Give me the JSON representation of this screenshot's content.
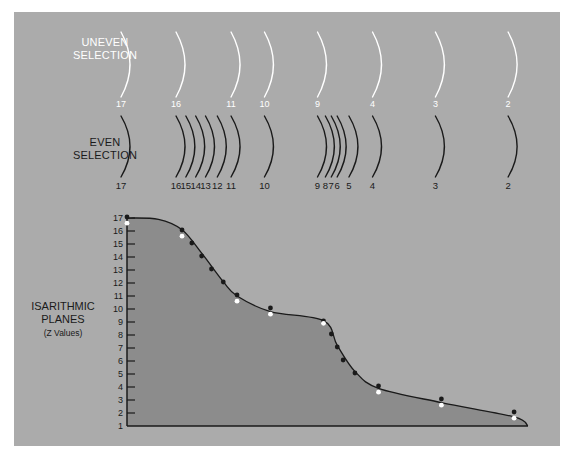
{
  "uneven_selection": {
    "label_line1": "UNEVEN",
    "label_line2": "SELECTION",
    "arcs": [
      {
        "value": "17",
        "pos": 0
      },
      {
        "value": "16",
        "pos": 1
      },
      {
        "value": "11",
        "pos": 6
      },
      {
        "value": "10",
        "pos": 7
      },
      {
        "value": "9",
        "pos": 8
      },
      {
        "value": "4",
        "pos": 13
      },
      {
        "value": "3",
        "pos": 14
      },
      {
        "value": "2",
        "pos": 15
      }
    ]
  },
  "even_selection": {
    "label_line1": "EVEN",
    "label_line2": "SELECTION",
    "arcs": [
      {
        "value": "17",
        "pos": 0
      },
      {
        "value": "16",
        "pos": 1
      },
      {
        "value": "15",
        "pos": 2
      },
      {
        "value": "14",
        "pos": 3
      },
      {
        "value": "13",
        "pos": 4
      },
      {
        "value": "12",
        "pos": 5
      },
      {
        "value": "11",
        "pos": 6
      },
      {
        "value": "10",
        "pos": 7
      },
      {
        "value": "9",
        "pos": 8
      },
      {
        "value": "8",
        "pos": 9
      },
      {
        "value": "7",
        "pos": 10
      },
      {
        "value": "6",
        "pos": 11
      },
      {
        "value": "5",
        "pos": 12
      },
      {
        "value": "4",
        "pos": 13
      },
      {
        "value": "3",
        "pos": 14
      },
      {
        "value": "2",
        "pos": 15
      }
    ]
  },
  "axis_title": {
    "line1": "ISARITHMIC",
    "line2": "PLANES",
    "line3": "(Z Values)"
  },
  "colors": {
    "panel": "#ababab",
    "profile_fill": "#8c8c8c",
    "ink": "#1a1a1a",
    "white": "#ffffff"
  },
  "chart_data": {
    "type": "area",
    "title": "",
    "ylabel": "ISARITHMIC PLANES (Z Values)",
    "xlabel": "",
    "ylim": [
      1,
      17
    ],
    "yticks": [
      "1",
      "2",
      "3",
      "4",
      "5",
      "6",
      "7",
      "8",
      "9",
      "10",
      "11",
      "12",
      "13",
      "14",
      "15",
      "16",
      "17"
    ],
    "grid": false,
    "x_positions_relative": [
      0,
      0.14,
      0.165,
      0.19,
      0.215,
      0.245,
      0.28,
      0.365,
      0.5,
      0.52,
      0.535,
      0.55,
      0.58,
      0.64,
      0.8,
      0.985
    ],
    "even_points": [
      {
        "z": 17,
        "x": 0.0
      },
      {
        "z": 16,
        "x": 0.14
      },
      {
        "z": 15,
        "x": 0.165
      },
      {
        "z": 14,
        "x": 0.19
      },
      {
        "z": 13,
        "x": 0.215
      },
      {
        "z": 12,
        "x": 0.245
      },
      {
        "z": 11,
        "x": 0.28
      },
      {
        "z": 10,
        "x": 0.365
      },
      {
        "z": 9,
        "x": 0.5
      },
      {
        "z": 8,
        "x": 0.52
      },
      {
        "z": 7,
        "x": 0.535
      },
      {
        "z": 6,
        "x": 0.55
      },
      {
        "z": 5,
        "x": 0.58
      },
      {
        "z": 4,
        "x": 0.64
      },
      {
        "z": 3,
        "x": 0.8
      },
      {
        "z": 2,
        "x": 0.985
      }
    ],
    "uneven_points": [
      {
        "z": 16.6,
        "x": 0.0
      },
      {
        "z": 15.6,
        "x": 0.14
      },
      {
        "z": 10.6,
        "x": 0.28
      },
      {
        "z": 9.6,
        "x": 0.365
      },
      {
        "z": 8.9,
        "x": 0.5
      },
      {
        "z": 3.6,
        "x": 0.64
      },
      {
        "z": 2.6,
        "x": 0.8
      },
      {
        "z": 1.6,
        "x": 0.985
      }
    ],
    "profile_curve": [
      {
        "x": 0.0,
        "z": 17.0
      },
      {
        "x": 0.08,
        "z": 16.9
      },
      {
        "x": 0.14,
        "z": 16.1
      },
      {
        "x": 0.19,
        "z": 14.3
      },
      {
        "x": 0.245,
        "z": 12.1
      },
      {
        "x": 0.28,
        "z": 11.0
      },
      {
        "x": 0.365,
        "z": 9.8
      },
      {
        "x": 0.5,
        "z": 9.1
      },
      {
        "x": 0.535,
        "z": 7.2
      },
      {
        "x": 0.58,
        "z": 5.2
      },
      {
        "x": 0.64,
        "z": 3.9
      },
      {
        "x": 0.8,
        "z": 2.8
      },
      {
        "x": 0.985,
        "z": 1.7
      },
      {
        "x": 1.02,
        "z": 1.0
      }
    ]
  }
}
